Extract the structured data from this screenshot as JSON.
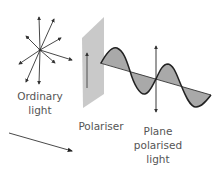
{
  "diagram": {
    "type": "physics-illustration",
    "colors": {
      "line": "#333333",
      "panel": "#c8c8c8",
      "wave_fill": "#a8a8a8",
      "text": "#555555"
    },
    "labels": {
      "ordinary": [
        "Ordinary",
        "light"
      ],
      "polariser": "Polariser",
      "plane": [
        "Plane",
        "polarised",
        "light"
      ]
    },
    "elements": [
      {
        "id": "unpolarised-burst",
        "desc": "arrows radiating in many directions from a central point",
        "center": [
          40,
          50
        ]
      },
      {
        "id": "polariser-panel",
        "desc": "grey slanted plane with a vertical arrow drawn on it"
      },
      {
        "id": "polarised-wave",
        "desc": "sine wave oscillating in a single vertical plane, shaded"
      },
      {
        "id": "oscillation-arrow",
        "desc": "double-headed vertical arrow indicating plane of vibration"
      },
      {
        "id": "direction-arrow",
        "desc": "arrow showing direction of propagation"
      }
    ]
  }
}
